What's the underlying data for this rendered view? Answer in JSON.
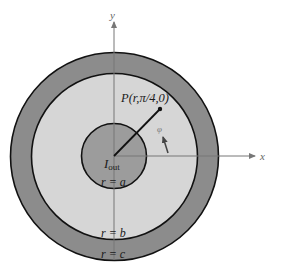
{
  "diagram": {
    "axes": {
      "x_label": "x",
      "y_label": "y"
    },
    "regions": {
      "outer_ring": {
        "color": "#8c8c8c"
      },
      "middle_region": {
        "color": "#d6d6d6"
      },
      "inner_conductor": {
        "color": "#9c9c9c"
      }
    },
    "labels": {
      "point": "P(r,π/4,0)",
      "current": "I",
      "current_sub": "out",
      "phi": "φ",
      "r_a": "r = a",
      "r_b": "r = b",
      "r_c": "r = c"
    },
    "geometry": {
      "center": [
        114,
        156
      ],
      "radius_a": 33,
      "radius_b": 83,
      "radius_c": 104,
      "point_P": [
        160,
        109
      ]
    }
  }
}
